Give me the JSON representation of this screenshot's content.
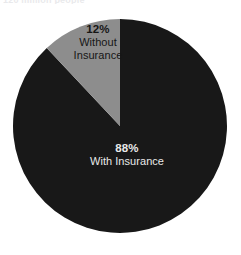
{
  "figure": {
    "top_text_remnant": "120 million people",
    "background_color": "#ffffff"
  },
  "chart_data": {
    "type": "pie",
    "title": "",
    "subtitle": "",
    "xlabel": "",
    "ylabel": "",
    "grid": false,
    "legend_position": "none",
    "units": "percent",
    "categories": [
      "With Insurance",
      "Without Insurance"
    ],
    "values": [
      88,
      12
    ],
    "start_angle_deg": 0,
    "direction": "counterclockwise",
    "slices": [
      {
        "label": "With Insurance",
        "percent": 88,
        "percent_text": "88%",
        "color": "#181818",
        "label_color": "#e9e9e9",
        "label_line_1": "88%",
        "label_line_2": "With Insurance"
      },
      {
        "label": "Without Insurance",
        "percent": 12,
        "percent_text": "12%",
        "color": "#8d8d8d",
        "label_color": "#161616",
        "label_line_1": "12%",
        "label_line_2": "Without",
        "label_line_3": "Insurance"
      }
    ],
    "colors": {
      "with_insurance": "#181818",
      "without_insurance": "#8d8d8d",
      "background": "#ffffff"
    },
    "geometry": {
      "center_x": 120,
      "center_y": 126,
      "radius": 107
    }
  }
}
